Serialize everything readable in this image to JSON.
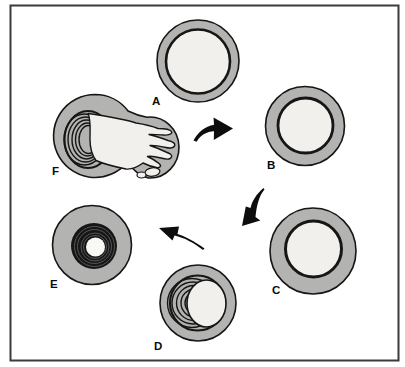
{
  "figure": {
    "type": "cycle-diagram",
    "colors": {
      "background": "#ffffff",
      "frame": "#3b3b3b",
      "wall_gray": "#b3b3b1",
      "interior_light": "#f1f0ec",
      "outline": "#161616",
      "arrow_black": "#0d0d0d",
      "core_white": "#f8f8f5",
      "groove_gray": "#5e5e5e"
    },
    "stages": [
      {
        "label": "A",
        "description": "circle with thin gray wall and light interior"
      },
      {
        "label": "B",
        "description": "circle with thicker gray wall"
      },
      {
        "label": "C",
        "description": "circle with thick gray wall, smaller interior"
      },
      {
        "label": "D",
        "description": "circle with layered membrane wrapping around light core"
      },
      {
        "label": "E",
        "description": "circle with dense dark multilayer ring around small white core"
      },
      {
        "label": "F",
        "description": "layered body with lobed finger-like structure emerging"
      }
    ],
    "arrows": [
      {
        "name": "arrow-a-to-b",
        "direction": "right"
      },
      {
        "name": "arrow-b-to-c",
        "direction": "down-left"
      },
      {
        "name": "arrow-d-to-e",
        "direction": "left"
      }
    ]
  }
}
